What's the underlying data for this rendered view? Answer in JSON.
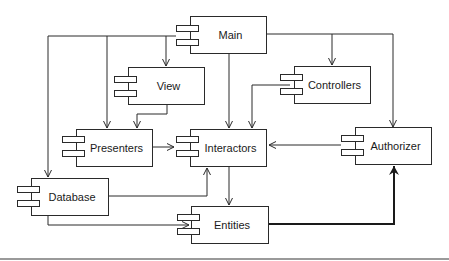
{
  "diagram": {
    "type": "uml-component-diagram",
    "components": [
      {
        "id": "main",
        "label": "Main"
      },
      {
        "id": "view",
        "label": "View"
      },
      {
        "id": "controllers",
        "label": "Controllers"
      },
      {
        "id": "presenters",
        "label": "Presenters"
      },
      {
        "id": "interactors",
        "label": "Interactors"
      },
      {
        "id": "authorizer",
        "label": "Authorizer"
      },
      {
        "id": "database",
        "label": "Database"
      },
      {
        "id": "entities",
        "label": "Entities"
      }
    ],
    "dependencies": [
      {
        "from": "Main",
        "to": "View"
      },
      {
        "from": "Main",
        "to": "Presenters"
      },
      {
        "from": "Main",
        "to": "Database"
      },
      {
        "from": "Main",
        "to": "Interactors"
      },
      {
        "from": "Main",
        "to": "Controllers"
      },
      {
        "from": "Main",
        "to": "Authorizer"
      },
      {
        "from": "View",
        "to": "Presenters"
      },
      {
        "from": "Controllers",
        "to": "Interactors"
      },
      {
        "from": "Presenters",
        "to": "Interactors"
      },
      {
        "from": "Authorizer",
        "to": "Interactors"
      },
      {
        "from": "Database",
        "to": "Interactors"
      },
      {
        "from": "Database",
        "to": "Entities"
      },
      {
        "from": "Interactors",
        "to": "Entities"
      },
      {
        "from": "Entities",
        "to": "Authorizer",
        "style": "bold"
      }
    ]
  }
}
